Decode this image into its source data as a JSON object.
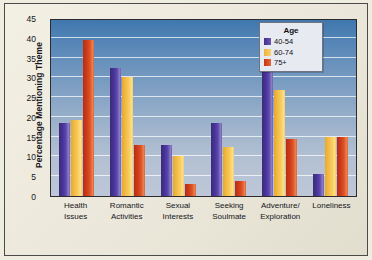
{
  "chart_data": {
    "type": "bar",
    "title": "",
    "xlabel": "",
    "ylabel": "Percentage Mentioning Theme",
    "ylim": [
      0,
      45
    ],
    "ytick_step": 5,
    "yticks": [
      0,
      5,
      10,
      15,
      20,
      25,
      30,
      35,
      40,
      45
    ],
    "grid": true,
    "legend_position": "top-right",
    "legend_title": "Age",
    "categories": [
      "Health Issues",
      "Romantic Activities",
      "Sexual Interests",
      "Seeking Soulmate",
      "Adventure/ Exploration",
      "Loneliness"
    ],
    "category_lines": [
      [
        "Health",
        "Issues"
      ],
      [
        "Romantic",
        "Activities"
      ],
      [
        "Sexual",
        "Interests"
      ],
      [
        "Seeking",
        "Soulmate"
      ],
      [
        "Adventure/",
        "Exploration"
      ],
      [
        "Loneliness",
        ""
      ]
    ],
    "series": [
      {
        "name": "40-54",
        "color": "#4a37a0",
        "values": [
          18.5,
          32.3,
          13.0,
          18.5,
          32.3,
          5.5
        ]
      },
      {
        "name": "60-74",
        "color": "#f3c054",
        "values": [
          19.3,
          30.0,
          10.0,
          12.5,
          26.7,
          15.0
        ]
      },
      {
        "name": "75+",
        "color": "#d4461f",
        "values": [
          39.5,
          13.0,
          3.0,
          3.8,
          14.5,
          15.0
        ]
      }
    ]
  },
  "colors": {
    "page_background": "#efece0",
    "frame_border": "#4a4a48",
    "plot_top": "#3f77ae",
    "plot_bottom": "#bdc7d8",
    "gridline": "#ffffff",
    "legend_background": "#e8eaf2",
    "legend_border": "#6f7480",
    "text": "#15151a"
  }
}
